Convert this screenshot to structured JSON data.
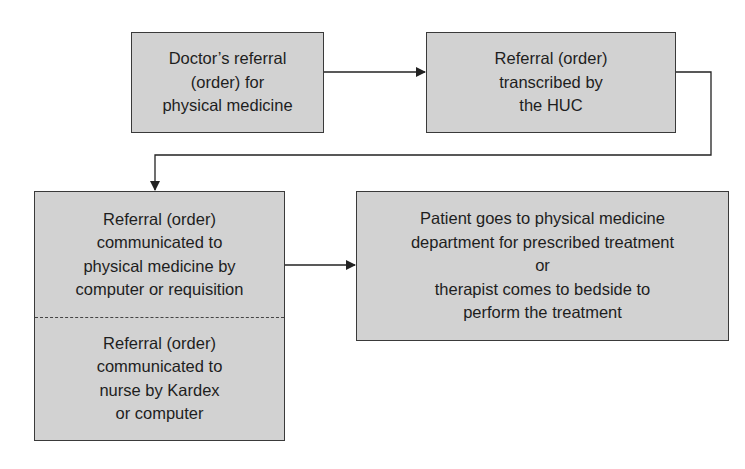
{
  "diagram": {
    "type": "flowchart",
    "nodes": [
      {
        "id": "doctor_referral",
        "lines": [
          "Doctor’s referral",
          "(order) for",
          "physical medicine"
        ]
      },
      {
        "id": "transcribed",
        "lines": [
          "Referral (order)",
          "transcribed by",
          "the HUC"
        ]
      },
      {
        "id": "communicated",
        "sections": [
          {
            "lines": [
              "Referral (order)",
              "communicated to",
              "physical medicine by",
              "computer or requisition"
            ]
          },
          {
            "lines": [
              "Referral (order)",
              "communicated to",
              "nurse by Kardex",
              "or computer"
            ]
          }
        ]
      },
      {
        "id": "treatment",
        "lines": [
          "Patient goes to physical medicine",
          "department for prescribed treatment",
          "or",
          "therapist comes to bedside to",
          "perform the treatment"
        ]
      }
    ],
    "edges": [
      {
        "from": "doctor_referral",
        "to": "transcribed"
      },
      {
        "from": "transcribed",
        "to": "communicated"
      },
      {
        "from": "communicated",
        "to": "treatment"
      }
    ],
    "colors": {
      "box_fill": "#d2d2d2",
      "border": "#3a3a3a",
      "text": "#1e1e1e"
    }
  }
}
